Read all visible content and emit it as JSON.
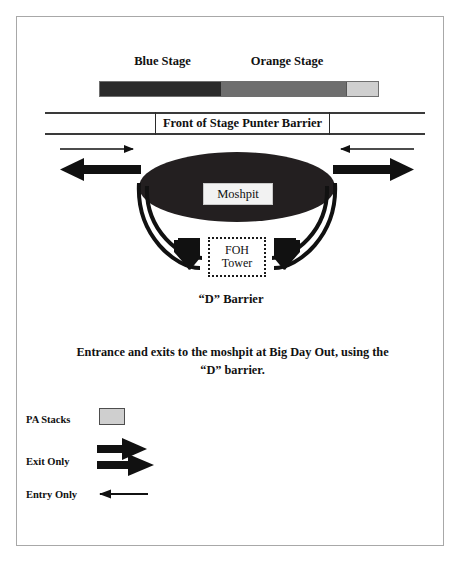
{
  "diagram": {
    "stages": {
      "blue_stage_label": "Blue Stage",
      "orange_stage_label": "Orange Stage",
      "blue_stage_color": "#2b2b2b",
      "orange_stage_color": "#6e6e6e",
      "pa_stack_color": "#cfcfcf"
    },
    "barrier": {
      "front_of_stage_label": "Front of Stage Punter Barrier"
    },
    "moshpit": {
      "label": "Moshpit",
      "fill_color": "#231f20"
    },
    "foh_tower": {
      "line1": "FOH",
      "line2": "Tower"
    },
    "d_barrier": {
      "label": "“D” Barrier"
    },
    "caption": {
      "line1": "Entrance and exits to the moshpit at Big Day Out, using the",
      "line2": "“D” barrier."
    },
    "legend": {
      "items": [
        {
          "label": "PA Stacks",
          "symbol": "gray-box"
        },
        {
          "label": "Exit Only",
          "symbol": "thick-arrow"
        },
        {
          "label": "Entry Only",
          "symbol": "thin-arrow"
        }
      ]
    }
  }
}
